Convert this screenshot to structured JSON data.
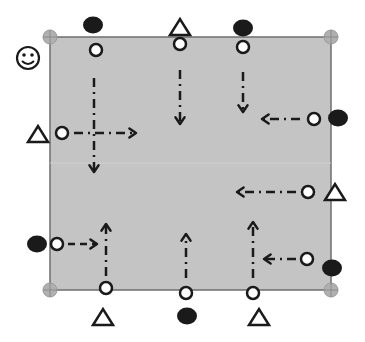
{
  "diagram": {
    "type": "drill-diagram",
    "field": {
      "x": 50,
      "y": 37,
      "w": 281,
      "h": 253,
      "fill": "#c4c4c4",
      "stroke": "#6e6e6e",
      "midline_y": 163
    },
    "corner_markers": [
      {
        "x": 50,
        "y": 37
      },
      {
        "x": 331,
        "y": 37
      },
      {
        "x": 50,
        "y": 290
      },
      {
        "x": 331,
        "y": 290
      }
    ],
    "coach": {
      "x": 28,
      "y": 58,
      "label": "coach-smiley"
    },
    "players_open": [
      {
        "x": 96,
        "y": 50
      },
      {
        "x": 180,
        "y": 44
      },
      {
        "x": 243,
        "y": 47
      },
      {
        "x": 62,
        "y": 133
      },
      {
        "x": 314,
        "y": 119
      },
      {
        "x": 308,
        "y": 192
      },
      {
        "x": 57,
        "y": 244
      },
      {
        "x": 307,
        "y": 259
      },
      {
        "x": 106,
        "y": 288
      },
      {
        "x": 186,
        "y": 293
      },
      {
        "x": 253,
        "y": 293
      }
    ],
    "players_filled": [
      {
        "x": 93,
        "y": 25
      },
      {
        "x": 243,
        "y": 28
      },
      {
        "x": 338,
        "y": 118
      },
      {
        "x": 37,
        "y": 244
      },
      {
        "x": 332,
        "y": 268
      },
      {
        "x": 187,
        "y": 316
      }
    ],
    "cones_triangle": [
      {
        "x": 180,
        "y": 28
      },
      {
        "x": 38,
        "y": 135
      },
      {
        "x": 335,
        "y": 193
      },
      {
        "x": 103,
        "y": 318
      },
      {
        "x": 259,
        "y": 318
      }
    ],
    "arrows": [
      {
        "from": [
          94,
          78
        ],
        "to": [
          94,
          172
        ],
        "style": "dashdot"
      },
      {
        "from": [
          74,
          133
        ],
        "to": [
          136,
          133
        ],
        "style": "dashdot"
      },
      {
        "from": [
          180,
          70
        ],
        "to": [
          180,
          124
        ],
        "style": "dashdot"
      },
      {
        "from": [
          243,
          72
        ],
        "to": [
          243,
          112
        ],
        "style": "dashdot"
      },
      {
        "from": [
          300,
          119
        ],
        "to": [
          262,
          119
        ],
        "style": "dashdot"
      },
      {
        "from": [
          296,
          192
        ],
        "to": [
          237,
          192
        ],
        "style": "dashdot"
      },
      {
        "from": [
          68,
          244
        ],
        "to": [
          97,
          244
        ],
        "style": "dash"
      },
      {
        "from": [
          106,
          276
        ],
        "to": [
          106,
          224
        ],
        "style": "dashdot"
      },
      {
        "from": [
          186,
          278
        ],
        "to": [
          186,
          234
        ],
        "style": "dashdot"
      },
      {
        "from": [
          253,
          278
        ],
        "to": [
          253,
          222
        ],
        "style": "dashdot"
      },
      {
        "from": [
          296,
          259
        ],
        "to": [
          264,
          259
        ],
        "style": "dashdot"
      }
    ],
    "colors": {
      "ink": "#1a1a1a",
      "marker": "#9a9a9a"
    }
  }
}
